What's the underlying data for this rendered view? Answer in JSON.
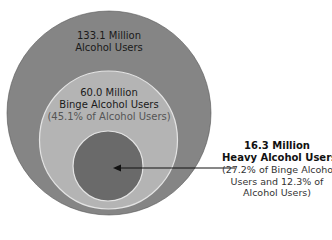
{
  "diagram": {
    "type": "nested-circles",
    "colors": {
      "outer_fill": "#858585",
      "binge_fill": "#b4b4b4",
      "heavy_fill": "#6a6a6a",
      "ring_stroke": "#e4e4e4",
      "arrow": "#111111"
    },
    "outer": {
      "value": "133.1 Million",
      "label": "Alcohol Users"
    },
    "binge": {
      "value": "60.0 Million",
      "label": "Binge Alcohol Users",
      "note": "(45.1% of Alcohol Users)"
    },
    "heavy": {
      "value": "16.3 Million",
      "label": "Heavy Alcohol Users",
      "note_lines": [
        "(27.2% of Binge Alcohol",
        "Users and 12.3% of",
        "Alcohol Users)"
      ]
    }
  }
}
